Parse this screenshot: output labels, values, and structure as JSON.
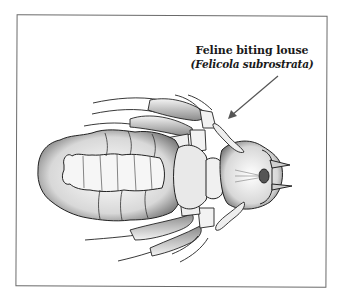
{
  "figure": {
    "type": "scientific-illustration",
    "label": {
      "common_name": "Feline biting louse",
      "scientific_name": "(Felicola subrostrata)"
    },
    "pointer": {
      "from": [
        278,
        76
      ],
      "to": [
        229,
        118
      ]
    },
    "colors": {
      "ink": "#1a1a1a",
      "frame": "#6a6a6a",
      "shade": "#9a9a9a",
      "paper": "#ffffff"
    }
  }
}
